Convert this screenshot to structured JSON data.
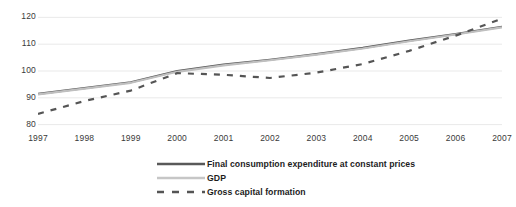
{
  "chart_data": {
    "type": "line",
    "title": "",
    "xlabel": "",
    "ylabel": "",
    "x": [
      1997,
      1998,
      1999,
      2000,
      2001,
      2002,
      2003,
      2004,
      2005,
      2006,
      2007
    ],
    "categories": [
      "1997",
      "1998",
      "1999",
      "2000",
      "2001",
      "2002",
      "2003",
      "2004",
      "2005",
      "2006",
      "2007"
    ],
    "ylim": [
      78,
      122
    ],
    "yticks": [
      80,
      90,
      100,
      110,
      120
    ],
    "ytick_labels": [
      "80",
      "90",
      "100",
      "110",
      "120"
    ],
    "xlim": [
      1997,
      2007
    ],
    "grid": true,
    "legend_position": "bottom",
    "series": [
      {
        "name": "Final consumption expenditure at constant prices",
        "style": "solid",
        "color": "#595959",
        "values": [
          91.5,
          93.6,
          95.8,
          100.0,
          102.4,
          104.2,
          106.3,
          108.6,
          111.3,
          113.8,
          116.5
        ]
      },
      {
        "name": "GDP",
        "style": "solid",
        "color": "#bfbfbf",
        "values": [
          91.3,
          93.4,
          95.6,
          99.7,
          102.1,
          104.0,
          106.1,
          108.4,
          111.1,
          113.6,
          116.3
        ]
      },
      {
        "name": "Gross capital formation",
        "style": "dashed",
        "color": "#555555",
        "values": [
          84.0,
          88.8,
          92.7,
          99.2,
          98.6,
          97.4,
          99.4,
          102.6,
          107.5,
          113.2,
          119.5
        ]
      }
    ]
  },
  "legend": {
    "items": [
      {
        "label": "Final consumption expenditure at constant prices",
        "marker": "solid-dark-line-icon"
      },
      {
        "label": "GDP",
        "marker": "solid-light-line-icon"
      },
      {
        "label": "Gross capital formation",
        "marker": "dashed-dark-line-icon"
      }
    ]
  }
}
